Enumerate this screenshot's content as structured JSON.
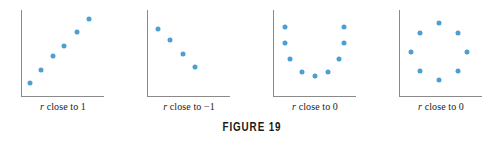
{
  "figure": {
    "caption": "FIGURE 19",
    "dot_color": "#4e9fd1",
    "axis_color": "#8a8a8a",
    "background_color": "#ffffff"
  },
  "chart_data": [
    {
      "type": "scatter",
      "title": "",
      "label_prefix": "r",
      "label_text": " close to 1",
      "label_full": "r close to 1",
      "correlation": 1,
      "xlabel": "",
      "ylabel": "",
      "xlim": [
        0,
        100
      ],
      "ylim": [
        0,
        100
      ],
      "grid": false,
      "points": [
        {
          "x": 11,
          "y": 16
        },
        {
          "x": 24,
          "y": 31
        },
        {
          "x": 38,
          "y": 47
        },
        {
          "x": 52,
          "y": 59
        },
        {
          "x": 68,
          "y": 75
        },
        {
          "x": 82,
          "y": 90
        }
      ]
    },
    {
      "type": "scatter",
      "title": "",
      "label_prefix": "r",
      "label_text": " close to −1",
      "label_full": "r close to −1",
      "correlation": -1,
      "xlabel": "",
      "ylabel": "",
      "xlim": [
        0,
        100
      ],
      "ylim": [
        0,
        100
      ],
      "grid": false,
      "points": [
        {
          "x": 13,
          "y": 78
        },
        {
          "x": 28,
          "y": 65
        },
        {
          "x": 43,
          "y": 50
        },
        {
          "x": 58,
          "y": 35
        }
      ]
    },
    {
      "type": "scatter",
      "title": "",
      "label_prefix": "r",
      "label_text": " close to 0",
      "label_full": "r close to 0",
      "correlation": 0,
      "xlabel": "",
      "ylabel": "",
      "xlim": [
        0,
        100
      ],
      "ylim": [
        0,
        100
      ],
      "grid": false,
      "points": [
        {
          "x": 15,
          "y": 80
        },
        {
          "x": 15,
          "y": 62
        },
        {
          "x": 21,
          "y": 44
        },
        {
          "x": 35,
          "y": 29
        },
        {
          "x": 51,
          "y": 24
        },
        {
          "x": 66,
          "y": 29
        },
        {
          "x": 79,
          "y": 44
        },
        {
          "x": 85,
          "y": 62
        },
        {
          "x": 85,
          "y": 80
        }
      ]
    },
    {
      "type": "scatter",
      "title": "",
      "label_prefix": "r",
      "label_text": " close to 0",
      "label_full": "r close to 0",
      "correlation": 0,
      "xlabel": "",
      "ylabel": "",
      "xlim": [
        0,
        100
      ],
      "ylim": [
        0,
        100
      ],
      "grid": false,
      "points": [
        {
          "x": 48,
          "y": 85
        },
        {
          "x": 25,
          "y": 74
        },
        {
          "x": 71,
          "y": 74
        },
        {
          "x": 14,
          "y": 52
        },
        {
          "x": 82,
          "y": 52
        },
        {
          "x": 25,
          "y": 30
        },
        {
          "x": 71,
          "y": 30
        },
        {
          "x": 48,
          "y": 19
        }
      ]
    }
  ]
}
